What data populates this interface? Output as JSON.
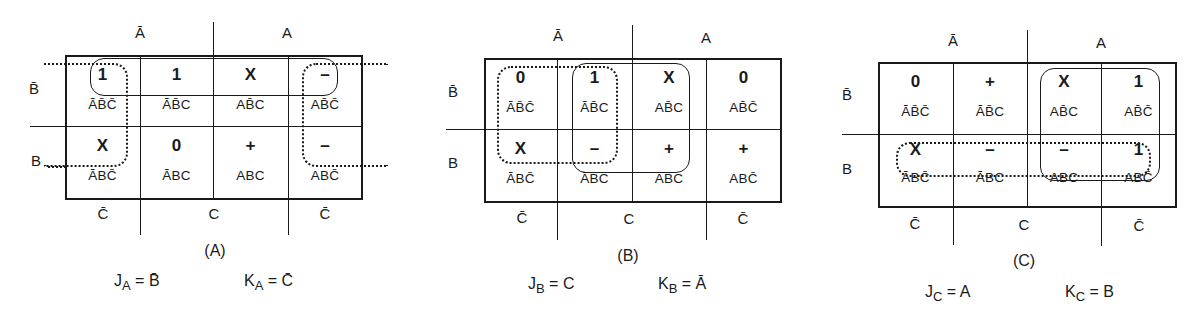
{
  "figure": {
    "column_header_labels": [
      "Ā",
      "A"
    ],
    "row_labels": [
      "B̄",
      "B"
    ],
    "column_footer_labels": [
      "C̄",
      "C",
      "C̄"
    ],
    "column_order_terms": [
      "ĀB̄C̄/ĀBC̄",
      "ĀB̄C/ĀBC",
      "AB̄C/ABC",
      "AB̄C̄/ABC̄"
    ],
    "legend_symbols": {
      "1": "one",
      "0": "zero",
      "X": "don't care",
      "+": "plus",
      "–": "dash"
    }
  },
  "maps": [
    {
      "id": "A",
      "caption": "(A)",
      "header_left": "Ā",
      "header_right": "A",
      "row_top_label": "B̄",
      "row_bottom_label": "B",
      "footer": [
        "C̄",
        "C",
        "C̄"
      ],
      "rows": [
        [
          {
            "value": "1",
            "term": "ĀB̄C̄"
          },
          {
            "value": "1",
            "term": "ĀB̄C"
          },
          {
            "value": "X",
            "term": "AB̄C"
          },
          {
            "value": "–",
            "term": "AB̄C̄"
          }
        ],
        [
          {
            "value": "X",
            "term": "ĀBC̄"
          },
          {
            "value": "0",
            "term": "ĀBC"
          },
          {
            "value": "+",
            "term": "ABC"
          },
          {
            "value": "–",
            "term": "ABC̄"
          }
        ]
      ],
      "groups": [
        {
          "style": "solid",
          "covers": "row B̄, all columns"
        },
        {
          "style": "dotted",
          "covers": "column C̄ (wrap-around), both rows"
        }
      ],
      "equation_j": {
        "lhs": "J",
        "sub": "A",
        "rhs": "B̄"
      },
      "equation_k": {
        "lhs": "K",
        "sub": "A",
        "rhs": "C̄"
      }
    },
    {
      "id": "B",
      "caption": "(B)",
      "header_left": "Ā",
      "header_right": "A",
      "row_top_label": "B̄",
      "row_bottom_label": "B",
      "footer": [
        "C̄",
        "C",
        "C̄"
      ],
      "rows": [
        [
          {
            "value": "0",
            "term": "ĀB̄C̄"
          },
          {
            "value": "1",
            "term": "ĀB̄C"
          },
          {
            "value": "X",
            "term": "AB̄C"
          },
          {
            "value": "0",
            "term": "AB̄C̄"
          }
        ],
        [
          {
            "value": "X",
            "term": "ĀBC̄"
          },
          {
            "value": "–",
            "term": "ĀBC"
          },
          {
            "value": "+",
            "term": "ABC"
          },
          {
            "value": "+",
            "term": "ABC̄"
          }
        ]
      ],
      "groups": [
        {
          "style": "dotted",
          "covers": "columns ĀC̄ and ĀC, both rows"
        },
        {
          "style": "solid",
          "covers": "columns ĀC and AC, both rows"
        }
      ],
      "equation_j": {
        "lhs": "J",
        "sub": "B",
        "rhs": "C"
      },
      "equation_k": {
        "lhs": "K",
        "sub": "B",
        "rhs": "Ā"
      }
    },
    {
      "id": "C",
      "caption": "(C)",
      "header_left": "Ā",
      "header_right": "A",
      "row_top_label": "B̄",
      "row_bottom_label": "B",
      "footer": [
        "C̄",
        "C",
        "C̄"
      ],
      "rows": [
        [
          {
            "value": "0",
            "term": "ĀB̄C̄"
          },
          {
            "value": "+",
            "term": "ĀB̄C"
          },
          {
            "value": "X",
            "term": "AB̄C"
          },
          {
            "value": "1",
            "term": "AB̄C̄"
          }
        ],
        [
          {
            "value": "X",
            "term": "ĀBC̄"
          },
          {
            "value": "–",
            "term": "ĀBC"
          },
          {
            "value": "–",
            "term": "ABC"
          },
          {
            "value": "1",
            "term": "ABC̄"
          }
        ]
      ],
      "groups": [
        {
          "style": "solid",
          "covers": "columns AC and AC̄, both rows"
        },
        {
          "style": "dotted",
          "covers": "row B, all columns"
        }
      ],
      "equation_j": {
        "lhs": "J",
        "sub": "C",
        "rhs": "A"
      },
      "equation_k": {
        "lhs": "K",
        "sub": "C",
        "rhs": "B"
      }
    }
  ]
}
